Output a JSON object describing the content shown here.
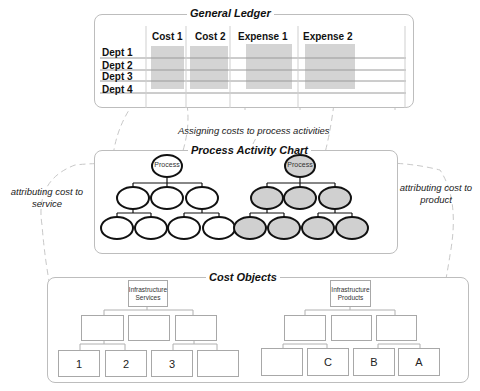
{
  "general_ledger": {
    "title": "General Ledger",
    "columns": [
      "Cost 1",
      "Cost 2",
      "Expense 1",
      "Expense 2"
    ],
    "rows": [
      "Dept 1",
      "Dept 2",
      "Dept 3",
      "Dept 4"
    ],
    "shaded_color": "#d4d4d4"
  },
  "assign_caption": "Assigning costs to process activities",
  "process_chart": {
    "title": "Process Activity Chart",
    "left_tree": {
      "root_label": "Process",
      "fill": "#ffffff",
      "level2_count": 3,
      "level3_count": 4
    },
    "right_tree": {
      "root_label": "Process",
      "fill": "#d0d0d0",
      "level2_count": 3,
      "level3_count": 4
    }
  },
  "left_caption": "attributing cost to service",
  "right_caption": "attributing cost to product",
  "cost_objects": {
    "title": "Cost Objects",
    "services": {
      "root_label": "Infrastructure Services",
      "root_line1": "Infrastructure",
      "root_line2": "Services",
      "leaves": [
        "1",
        "2",
        "3",
        ""
      ]
    },
    "products": {
      "root_label": "Infrastructure Products",
      "root_line1": "Infrastructure",
      "root_line2": "Products",
      "leaves": [
        "",
        "C",
        "B",
        "A"
      ]
    }
  }
}
